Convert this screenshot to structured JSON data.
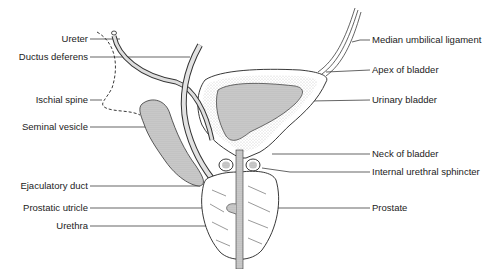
{
  "diagram": {
    "left_labels": [
      {
        "id": "ureter",
        "text": "Ureter"
      },
      {
        "id": "ductus-deferens",
        "text": "Ductus deferens"
      },
      {
        "id": "ischial-spine",
        "text": "Ischial spine"
      },
      {
        "id": "seminal-vesicle",
        "text": "Seminal vesicle"
      },
      {
        "id": "ejaculatory-duct",
        "text": "Ejaculatory duct"
      },
      {
        "id": "prostatic-utricle",
        "text": "Prostatic utricle"
      },
      {
        "id": "urethra",
        "text": "Urethra"
      }
    ],
    "right_labels": [
      {
        "id": "median-umbilical-ligament",
        "text": "Median umbilical ligament"
      },
      {
        "id": "apex-of-bladder",
        "text": "Apex of bladder"
      },
      {
        "id": "urinary-bladder",
        "text": "Urinary bladder"
      },
      {
        "id": "neck-of-bladder",
        "text": "Neck of bladder"
      },
      {
        "id": "internal-urethral-sphincter",
        "text": "Internal urethral sphincter"
      },
      {
        "id": "prostate",
        "text": "Prostate"
      }
    ],
    "colors": {
      "line": "#222222",
      "stipple": "#b8b8b8",
      "background": "#ffffff"
    }
  }
}
